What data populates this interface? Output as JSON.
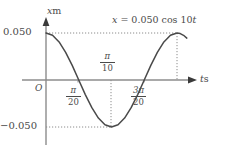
{
  "figure": {
    "title": "",
    "background_color": "#ffffff",
    "curve_color": "#4a4a4a",
    "axis_color": "#8c8c8c",
    "guide_color": "#8c8c8c"
  },
  "annotation": {
    "equation_var": "x",
    "equation_eq": " = ",
    "equation_amplitude": "0.050",
    "equation_func": " cos 10",
    "equation_time": "t"
  },
  "axes": {
    "y_label_symbol": "x",
    "y_label_unit": "m",
    "x_label_symbol": "t",
    "x_label_unit": "s",
    "origin_label": "O",
    "y_tick_positive": "0.050",
    "y_tick_negative": "−0.050"
  },
  "x_ticks": [
    {
      "name": "pi-over-20",
      "numerator": "π",
      "denominator": "20",
      "position": "below-axis"
    },
    {
      "name": "pi-over-10",
      "numerator": "π",
      "denominator": "10",
      "position": "above-axis"
    },
    {
      "name": "three-pi-over-20",
      "numerator": "3π",
      "denominator": "20",
      "position": "below-axis"
    }
  ],
  "chart_data": {
    "type": "line",
    "title": "",
    "equation": "x = 0.050 cos 10t",
    "xlabel": "t s",
    "ylabel": "x m",
    "xlim": [
      0,
      0.6283185307
    ],
    "ylim": [
      -0.05,
      0.05
    ],
    "grid": false,
    "legend": null,
    "amplitude": 0.05,
    "angular_frequency": 10,
    "period": 0.6283185307,
    "x_tick_values": [
      0.1570796327,
      0.3141592654,
      0.471238898
    ],
    "x_tick_labels": [
      "π/20",
      "π/10",
      "3π/20"
    ],
    "y_tick_values": [
      0.05,
      -0.05
    ],
    "y_tick_labels": [
      "0.050",
      "−0.050"
    ],
    "dotted_guides": {
      "horizontal_at_y": [
        0.05,
        -0.05
      ],
      "vertical_at_x": [
        0.3141592654,
        0.6283185307
      ]
    },
    "key_points": [
      {
        "t": 0.0,
        "x": 0.05,
        "note": "maximum"
      },
      {
        "t": 0.1570796327,
        "x": 0.0,
        "note": "zero crossing descending"
      },
      {
        "t": 0.3141592654,
        "x": -0.05,
        "note": "minimum"
      },
      {
        "t": 0.471238898,
        "x": 0.0,
        "note": "zero crossing ascending"
      },
      {
        "t": 0.6283185307,
        "x": 0.05,
        "note": "maximum"
      }
    ],
    "series": [
      {
        "name": "x = 0.050 cos 10t",
        "x": [
          0.0,
          0.0314,
          0.0628,
          0.0942,
          0.1257,
          0.1571,
          0.1885,
          0.2199,
          0.2513,
          0.2827,
          0.3142,
          0.3456,
          0.377,
          0.4084,
          0.4398,
          0.4712,
          0.5027,
          0.5341,
          0.5655,
          0.5969,
          0.6283
        ],
        "values": [
          0.05,
          0.0476,
          0.0405,
          0.0294,
          0.0155,
          0.0,
          -0.0155,
          -0.0294,
          -0.0405,
          -0.0476,
          -0.05,
          -0.0476,
          -0.0405,
          -0.0294,
          -0.0155,
          0.0,
          0.0155,
          0.0294,
          0.0405,
          0.0476,
          0.05
        ]
      }
    ]
  }
}
